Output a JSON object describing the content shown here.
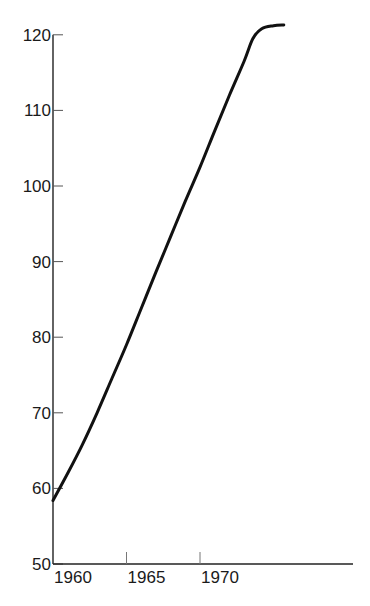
{
  "chart_data": {
    "type": "line",
    "title": "",
    "xlabel": "",
    "ylabel": "",
    "xlim": [
      1960,
      1980.4
    ],
    "ylim": [
      50,
      120
    ],
    "grid": false,
    "legend": null,
    "x_ticks": [
      1960,
      1965,
      1970
    ],
    "y_ticks": [
      50,
      60,
      70,
      80,
      90,
      100,
      110,
      120
    ],
    "series": [
      {
        "name": "curve",
        "color": "#111111",
        "points": [
          {
            "x": 1960.0,
            "y": 58.4
          },
          {
            "x": 1961.0,
            "y": 62.0
          },
          {
            "x": 1962.0,
            "y": 65.8
          },
          {
            "x": 1963.0,
            "y": 70.0
          },
          {
            "x": 1964.0,
            "y": 74.5
          },
          {
            "x": 1965.0,
            "y": 79.0
          },
          {
            "x": 1966.0,
            "y": 83.8
          },
          {
            "x": 1967.0,
            "y": 88.6
          },
          {
            "x": 1968.0,
            "y": 93.3
          },
          {
            "x": 1969.0,
            "y": 98.0
          },
          {
            "x": 1970.0,
            "y": 102.5
          },
          {
            "x": 1971.0,
            "y": 107.3
          },
          {
            "x": 1972.0,
            "y": 112.0
          },
          {
            "x": 1973.0,
            "y": 116.5
          },
          {
            "x": 1973.6,
            "y": 119.5
          },
          {
            "x": 1974.2,
            "y": 120.8
          },
          {
            "x": 1975.0,
            "y": 121.2
          },
          {
            "x": 1975.7,
            "y": 121.3
          }
        ]
      }
    ]
  }
}
